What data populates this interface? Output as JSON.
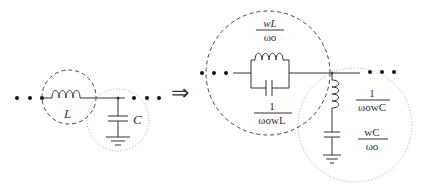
{
  "left_circuit": {
    "inductor_label": "L",
    "capacitor_label": "C"
  },
  "arrow": "⇒",
  "right_circuit": {
    "parallel_top": {
      "num": "wL",
      "den": "ωo"
    },
    "parallel_bottom": {
      "num": "1",
      "den": "ωowL"
    },
    "shunt_top": {
      "num": "1",
      "den": "ωowC"
    },
    "shunt_bottom": {
      "num": "wC",
      "den": "ωo"
    }
  },
  "colors": {
    "line": "#333333",
    "dashed": "#444444",
    "dotted": "#aaaaaa"
  }
}
